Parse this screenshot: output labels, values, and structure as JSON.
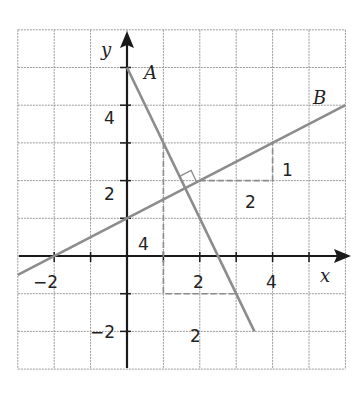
{
  "chart_data": {
    "type": "line",
    "title": "",
    "xlabel": "x",
    "ylabel": "y",
    "xlim": [
      -3,
      6
    ],
    "ylim": [
      -3,
      6
    ],
    "grid": true,
    "x_ticks": [
      -2,
      2,
      4
    ],
    "y_ticks": [
      -2,
      2,
      4
    ],
    "series": [
      {
        "name": "A",
        "equation": "y = -2x + 5",
        "points": [
          [
            0,
            5
          ],
          [
            3.5,
            -2
          ]
        ]
      },
      {
        "name": "B",
        "equation": "y = 0.5x + 1",
        "points": [
          [
            -3,
            -0.5
          ],
          [
            6,
            4
          ]
        ]
      }
    ],
    "intersection": {
      "x": 1.6,
      "y": 1.8,
      "right_angle_marker": true
    },
    "slope_triangles": [
      {
        "line": "B",
        "path": [
          [
            2,
            2
          ],
          [
            4,
            2
          ],
          [
            4,
            3
          ]
        ],
        "run_label": "2",
        "rise_label": "1"
      },
      {
        "line": "A",
        "path": [
          [
            1,
            3
          ],
          [
            1,
            -1
          ],
          [
            3,
            -1
          ]
        ],
        "run_label": "2",
        "rise_label": "4"
      }
    ],
    "annotations": [
      {
        "text": "A",
        "x": 0.55,
        "y": 4.85
      },
      {
        "text": "B",
        "x": 5.3,
        "y": 4.35
      },
      {
        "text": "1",
        "x": 4.45,
        "y": 2.4
      },
      {
        "text": "2",
        "x": 3.3,
        "y": 1.35
      },
      {
        "text": "4",
        "x": 0.35,
        "y": 0.25
      },
      {
        "text": "2",
        "x": 2.2,
        "y": -2.3
      }
    ]
  },
  "labels": {
    "x_axis": "x",
    "y_axis": "y",
    "line_a": "A",
    "line_b": "B",
    "tick_x_neg2": "−2",
    "tick_x_2": "2",
    "tick_x_4": "4",
    "tick_y_4": "4",
    "tick_y_2": "2",
    "tick_y_neg2": "−2",
    "rise_b": "1",
    "run_b": "2",
    "rise_a": "4",
    "run_a": "2"
  },
  "colors": {
    "grid": "#9a9a9a",
    "axis": "#1a1a1a",
    "lines": "#8c8c8c",
    "text": "#222222"
  }
}
